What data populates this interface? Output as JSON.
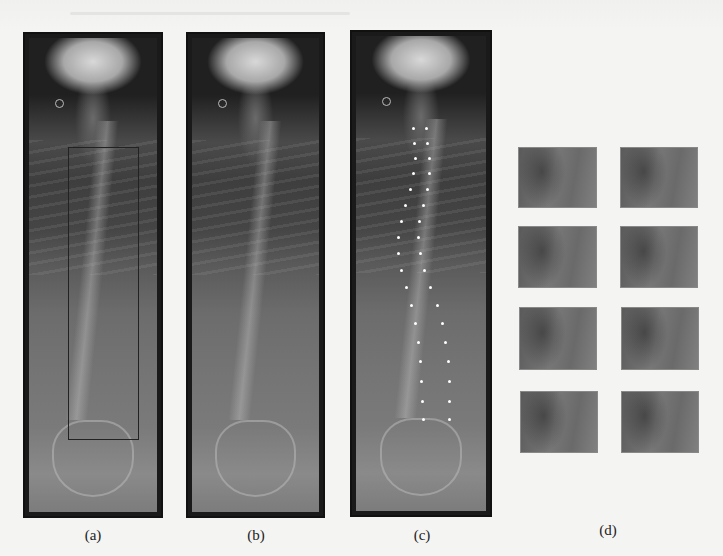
{
  "figure": {
    "panels": [
      {
        "id": "a",
        "caption": "(a)",
        "description": "Full-spine X-ray with bounding box around thoracolumbar region"
      },
      {
        "id": "b",
        "caption": "(b)",
        "description": "Full-spine X-ray"
      },
      {
        "id": "c",
        "caption": "(c)",
        "description": "Full-spine X-ray with vertebra corner landmarks marked"
      },
      {
        "id": "d",
        "caption": "(d)",
        "description": "Cropped vertebra patches, 4 rows by 2 columns"
      }
    ],
    "patch_grid": {
      "rows": 4,
      "cols": 2,
      "count": 8
    },
    "colors": {
      "background": "#f4f4f2",
      "panel_border": "#111111",
      "landmark_dots": "#ffffff",
      "bbox": "#222222"
    }
  }
}
